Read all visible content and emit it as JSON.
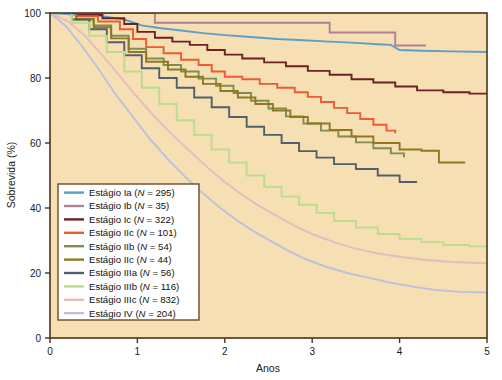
{
  "chart_data": {
    "type": "line",
    "title": "",
    "subtitle": "",
    "xlabel": "Anos",
    "ylabel": "Sobrevida (%)",
    "xlim": [
      0,
      5
    ],
    "ylim": [
      0,
      100
    ],
    "xticks": [
      0,
      1,
      2,
      3,
      4,
      5
    ],
    "xtick_labels": [
      "0",
      "1",
      "2",
      "3",
      "4",
      "5"
    ],
    "yticks": [
      0,
      20,
      40,
      60,
      80,
      100
    ],
    "ytick_labels": [
      "0",
      "20",
      "40",
      "60",
      "80",
      "100"
    ],
    "grid": false,
    "legend_position": "lower left",
    "plot_background": "#f6dfb3",
    "plot_border_color": "#4a3418",
    "curve_style": "step",
    "series": [
      {
        "name": "Estágio Ia",
        "label": "Estágio Ia (N = 295)",
        "n": 295,
        "color": "#5d9ec9",
        "points": [
          [
            0,
            100
          ],
          [
            0.25,
            99.6
          ],
          [
            0.55,
            99.2
          ],
          [
            0.85,
            98.0
          ],
          [
            1.05,
            96.2
          ],
          [
            1.25,
            95.4
          ],
          [
            1.5,
            94.6
          ],
          [
            1.75,
            93.8
          ],
          [
            2.0,
            93.2
          ],
          [
            2.3,
            92.6
          ],
          [
            2.6,
            92.0
          ],
          [
            2.9,
            91.6
          ],
          [
            3.2,
            91.2
          ],
          [
            3.5,
            90.8
          ],
          [
            3.75,
            90.4
          ],
          [
            3.9,
            90.2
          ],
          [
            4.0,
            88.6
          ],
          [
            4.25,
            88.4
          ],
          [
            4.6,
            88.2
          ],
          [
            5.0,
            88.0
          ]
        ]
      },
      {
        "name": "Estágio Ib",
        "label": "Estágio Ib (N = 35)",
        "n": 35,
        "color": "#b08098",
        "points": [
          [
            0,
            100
          ],
          [
            0.4,
            100
          ],
          [
            0.9,
            100
          ],
          [
            1.2,
            97.0
          ],
          [
            1.6,
            97.0
          ],
          [
            2.0,
            97.0
          ],
          [
            2.4,
            97.0
          ],
          [
            2.8,
            97.0
          ],
          [
            3.2,
            94.0
          ],
          [
            3.5,
            94.0
          ],
          [
            3.75,
            94.0
          ],
          [
            3.95,
            90.0
          ],
          [
            4.3,
            90.0
          ]
        ]
      },
      {
        "name": "Estágio Ic",
        "label": "Estágio Ic (N = 322)",
        "n": 322,
        "color": "#6d1f2a",
        "points": [
          [
            0,
            100
          ],
          [
            0.3,
            99.4
          ],
          [
            0.6,
            98.4
          ],
          [
            0.85,
            96.6
          ],
          [
            1.0,
            94.2
          ],
          [
            1.2,
            92.4
          ],
          [
            1.4,
            91.2
          ],
          [
            1.6,
            90.2
          ],
          [
            1.8,
            88.6
          ],
          [
            2.0,
            87.2
          ],
          [
            2.2,
            86.0
          ],
          [
            2.45,
            84.8
          ],
          [
            2.7,
            83.6
          ],
          [
            2.95,
            82.2
          ],
          [
            3.2,
            81.0
          ],
          [
            3.45,
            79.6
          ],
          [
            3.7,
            78.6
          ],
          [
            3.95,
            77.4
          ],
          [
            4.2,
            76.2
          ],
          [
            4.5,
            75.6
          ],
          [
            4.8,
            75.2
          ],
          [
            5.0,
            75.0
          ]
        ]
      },
      {
        "name": "Estágio IIc",
        "label": "Estágio IIc (N = 101)",
        "n": 101,
        "color": "#ee5a33",
        "points": [
          [
            0,
            100
          ],
          [
            0.3,
            99.0
          ],
          [
            0.55,
            97.4
          ],
          [
            0.8,
            95.0
          ],
          [
            0.95,
            92.0
          ],
          [
            1.1,
            89.5
          ],
          [
            1.3,
            87.6
          ],
          [
            1.5,
            85.6
          ],
          [
            1.7,
            84.0
          ],
          [
            1.85,
            82.0
          ],
          [
            2.0,
            80.4
          ],
          [
            2.2,
            79.6
          ],
          [
            2.4,
            78.2
          ],
          [
            2.6,
            77.0
          ],
          [
            2.8,
            75.6
          ],
          [
            2.95,
            74.2
          ],
          [
            3.1,
            72.6
          ],
          [
            3.25,
            70.8
          ],
          [
            3.4,
            69.2
          ],
          [
            3.55,
            67.4
          ],
          [
            3.7,
            65.6
          ],
          [
            3.85,
            63.8
          ],
          [
            3.95,
            63.0
          ]
        ]
      },
      {
        "name": "Estágio IIb",
        "label": "Estágio IIb (N = 54)",
        "n": 54,
        "color": "#7d8f4e",
        "points": [
          [
            0,
            100
          ],
          [
            0.3,
            98.2
          ],
          [
            0.5,
            96.2
          ],
          [
            0.7,
            93.0
          ],
          [
            0.9,
            89.0
          ],
          [
            1.1,
            86.0
          ],
          [
            1.3,
            84.0
          ],
          [
            1.5,
            82.0
          ],
          [
            1.7,
            79.8
          ],
          [
            1.9,
            77.6
          ],
          [
            2.1,
            75.4
          ],
          [
            2.3,
            73.0
          ],
          [
            2.5,
            70.6
          ],
          [
            2.7,
            68.2
          ],
          [
            2.9,
            66.0
          ],
          [
            3.1,
            63.8
          ],
          [
            3.3,
            62.0
          ],
          [
            3.5,
            60.2
          ],
          [
            3.7,
            58.4
          ],
          [
            3.9,
            56.8
          ],
          [
            4.05,
            55.6
          ]
        ]
      },
      {
        "name": "Estágio IIc",
        "label": "Estágio IIc (N = 44)",
        "n": 44,
        "color": "#8f7820",
        "points": [
          [
            0,
            100
          ],
          [
            0.3,
            98.0
          ],
          [
            0.5,
            95.6
          ],
          [
            0.7,
            92.2
          ],
          [
            0.9,
            88.0
          ],
          [
            1.1,
            85.0
          ],
          [
            1.35,
            82.6
          ],
          [
            1.55,
            80.4
          ],
          [
            1.75,
            78.2
          ],
          [
            1.95,
            76.0
          ],
          [
            2.15,
            74.0
          ],
          [
            2.35,
            72.0
          ],
          [
            2.55,
            70.0
          ],
          [
            2.75,
            68.0
          ],
          [
            2.95,
            66.0
          ],
          [
            3.2,
            64.0
          ],
          [
            3.45,
            62.0
          ],
          [
            3.7,
            60.0
          ],
          [
            4.0,
            58.0
          ],
          [
            4.25,
            57.6
          ],
          [
            4.45,
            54.0
          ],
          [
            4.75,
            54.0
          ]
        ]
      },
      {
        "name": "Estágio IIIa",
        "label": "Estágio IIIa (N = 56)",
        "n": 56,
        "color": "#52606b",
        "points": [
          [
            0,
            100
          ],
          [
            0.25,
            98.0
          ],
          [
            0.45,
            95.0
          ],
          [
            0.65,
            91.0
          ],
          [
            0.85,
            87.0
          ],
          [
            1.05,
            83.0
          ],
          [
            1.25,
            80.0
          ],
          [
            1.45,
            77.0
          ],
          [
            1.65,
            74.0
          ],
          [
            1.85,
            71.0
          ],
          [
            2.05,
            68.0
          ],
          [
            2.25,
            65.0
          ],
          [
            2.45,
            62.5
          ],
          [
            2.65,
            60.0
          ],
          [
            2.85,
            57.5
          ],
          [
            3.05,
            55.5
          ],
          [
            3.25,
            53.5
          ],
          [
            3.5,
            52.0
          ],
          [
            3.75,
            50.0
          ],
          [
            4.0,
            48.0
          ],
          [
            4.2,
            48.0
          ]
        ]
      },
      {
        "name": "Estágio IIIb",
        "label": "Estágio IIIb (N = 116)",
        "n": 116,
        "color": "#b9dd8d",
        "points": [
          [
            0,
            100
          ],
          [
            0.25,
            97.0
          ],
          [
            0.45,
            93.0
          ],
          [
            0.65,
            88.0
          ],
          [
            0.85,
            82.0
          ],
          [
            1.05,
            77.0
          ],
          [
            1.25,
            72.0
          ],
          [
            1.45,
            67.0
          ],
          [
            1.65,
            62.5
          ],
          [
            1.85,
            58.0
          ],
          [
            2.05,
            54.0
          ],
          [
            2.25,
            50.0
          ],
          [
            2.45,
            46.5
          ],
          [
            2.65,
            43.5
          ],
          [
            2.85,
            41.0
          ],
          [
            3.05,
            38.5
          ],
          [
            3.25,
            36.0
          ],
          [
            3.5,
            34.0
          ],
          [
            3.75,
            32.0
          ],
          [
            4.0,
            30.5
          ],
          [
            4.25,
            29.5
          ],
          [
            4.5,
            28.6
          ],
          [
            4.8,
            28.2
          ],
          [
            5.0,
            28.0
          ]
        ]
      },
      {
        "name": "Estágio IIIc",
        "label": "Estágio IIIc (N = 832)",
        "n": 832,
        "color": "#e3bdbd",
        "points": [
          [
            0,
            100
          ],
          [
            0.2,
            97.5
          ],
          [
            0.4,
            93.0
          ],
          [
            0.6,
            87.0
          ],
          [
            0.8,
            80.5
          ],
          [
            1.0,
            74.0
          ],
          [
            1.2,
            68.0
          ],
          [
            1.4,
            62.5
          ],
          [
            1.6,
            57.5
          ],
          [
            1.8,
            52.5
          ],
          [
            2.0,
            48.0
          ],
          [
            2.2,
            44.0
          ],
          [
            2.4,
            40.5
          ],
          [
            2.6,
            37.5
          ],
          [
            2.8,
            34.5
          ],
          [
            3.0,
            32.0
          ],
          [
            3.25,
            29.5
          ],
          [
            3.5,
            27.5
          ],
          [
            3.75,
            26.0
          ],
          [
            4.0,
            25.0
          ],
          [
            4.3,
            24.0
          ],
          [
            4.6,
            23.4
          ],
          [
            5.0,
            23.0
          ]
        ]
      },
      {
        "name": "Estágio IV",
        "label": "Estágio IV (N = 204)",
        "n": 204,
        "color": "#bcc0dd",
        "points": [
          [
            0,
            100
          ],
          [
            0.18,
            96.0
          ],
          [
            0.36,
            90.0
          ],
          [
            0.55,
            83.0
          ],
          [
            0.75,
            75.0
          ],
          [
            0.95,
            68.0
          ],
          [
            1.15,
            61.0
          ],
          [
            1.35,
            55.0
          ],
          [
            1.55,
            49.5
          ],
          [
            1.75,
            44.5
          ],
          [
            1.95,
            40.0
          ],
          [
            2.15,
            36.0
          ],
          [
            2.35,
            32.5
          ],
          [
            2.55,
            29.5
          ],
          [
            2.75,
            26.5
          ],
          [
            2.95,
            24.0
          ],
          [
            3.15,
            22.0
          ],
          [
            3.4,
            20.0
          ],
          [
            3.65,
            18.5
          ],
          [
            3.9,
            17.0
          ],
          [
            4.15,
            15.8
          ],
          [
            4.4,
            14.8
          ],
          [
            4.7,
            14.2
          ],
          [
            5.0,
            14.0
          ]
        ]
      }
    ]
  },
  "legend": {
    "items": [
      {
        "label": "Estágio Ia (N = 295)",
        "prefix": "Estágio Ia (",
        "italic": "N",
        "suffix": " = 295)",
        "color": "#5d9ec9"
      },
      {
        "label": "Estágio Ib (N = 35)",
        "prefix": "Estágio Ib (",
        "italic": "N",
        "suffix": " = 35)",
        "color": "#b08098"
      },
      {
        "label": "Estágio Ic (N = 322)",
        "prefix": "Estágio Ic (",
        "italic": "N",
        "suffix": " = 322)",
        "color": "#6d1f2a"
      },
      {
        "label": "Estágio IIc (N = 101)",
        "prefix": "Estágio IIc (",
        "italic": "N",
        "suffix": " = 101)",
        "color": "#ee5a33"
      },
      {
        "label": "Estágio IIb (N = 54)",
        "prefix": "Estágio IIb (",
        "italic": "N",
        "suffix": " = 54)",
        "color": "#7d8f4e"
      },
      {
        "label": "Estágio IIc (N = 44)",
        "prefix": "Estágio IIc (",
        "italic": "N",
        "suffix": " = 44)",
        "color": "#8f7820"
      },
      {
        "label": "Estágio IIIa (N = 56)",
        "prefix": "Estágio IIIa (",
        "italic": "N",
        "suffix": " = 56)",
        "color": "#52606b"
      },
      {
        "label": "Estágio IIIb (N = 116)",
        "prefix": "Estágio IIIb (",
        "italic": "N",
        "suffix": " = 116)",
        "color": "#b9dd8d"
      },
      {
        "label": "Estágio IIIc (N = 832)",
        "prefix": "Estágio IIIc (",
        "italic": "N",
        "suffix": " = 832)",
        "color": "#e3bdbd"
      },
      {
        "label": "Estágio IV (N = 204)",
        "prefix": "Estágio IV (",
        "italic": "N",
        "suffix": " = 204)",
        "color": "#bcc0dd"
      }
    ],
    "background": "#ffffff",
    "border_color": "#6b4a2a"
  }
}
